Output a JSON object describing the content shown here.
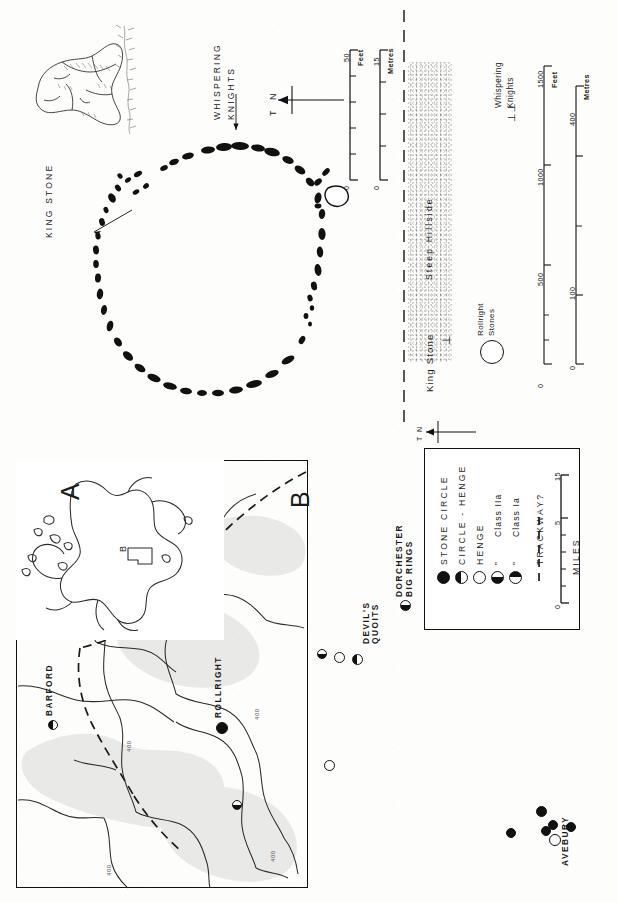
{
  "figure": {
    "orientation": "rotated-90-clockwise",
    "panels": [
      "map-A-britain-inset",
      "map-B-region",
      "legend",
      "rollright-circle-plan",
      "site-context-plan"
    ]
  },
  "map_a": {
    "panel_letter": "A",
    "inset_label": "B",
    "description": "outline of Britain with rectangle marking area B"
  },
  "map_b": {
    "panel_letter": "B",
    "sites": [
      {
        "name": "BARFORD",
        "symbol": "circle-half-left",
        "x": 52,
        "y": 724
      },
      {
        "name": "ROLLRIGHT",
        "symbol": "circle-filled",
        "x": 221,
        "y": 726
      },
      {
        "name": "DEVIL'S QUOITS",
        "symbol": "circle-half-bottom",
        "x": 343,
        "y": 652
      },
      {
        "name": "DORCHESTER BIG RINGS",
        "symbol": "circle-half-bottom",
        "x": 402,
        "y": 604
      },
      {
        "name": "AVEBURY",
        "symbol": "circle-open",
        "x": 540,
        "y": 832
      }
    ],
    "contour_labels": [
      "400",
      "400",
      "400",
      "400"
    ],
    "trackway_style": "dashed line"
  },
  "legend": {
    "entries": [
      {
        "symbol": "circle-filled",
        "label": "STONE CIRCLE"
      },
      {
        "symbol": "circle-half-left",
        "label": "CIRCLE - HENGE"
      },
      {
        "symbol": "circle-open",
        "label": "HENGE"
      },
      {
        "symbol": "circle-half-top",
        "label": "Class IIa",
        "prefix": "”"
      },
      {
        "symbol": "circle-half-bottom",
        "label": "Class Ia",
        "prefix": "”"
      },
      {
        "symbol": "dashed-line",
        "label": "TRACKWAY?"
      }
    ],
    "scale": {
      "unit": "MILES",
      "ticks": [
        "0",
        "5",
        "15"
      ],
      "min": 0,
      "max": 15
    }
  },
  "circle_plan": {
    "labels": [
      {
        "text": "KING STONE",
        "type": "annotation-with-arrow"
      },
      {
        "text": "WHISPERING KNIGHTS",
        "type": "annotation-with-arrow"
      }
    ],
    "north_arrow": {
      "label_true": "T",
      "label_north": "N"
    },
    "stone_count_visible": 60,
    "scale_feet": {
      "unit": "Feet",
      "ticks": [
        "0",
        "50"
      ],
      "min": 0,
      "max": 50
    },
    "scale_metres": {
      "unit": "Metres",
      "ticks": [
        "0",
        "15"
      ],
      "min": 0,
      "max": 15
    },
    "king_stone_drawing": "shaded pen drawing of the King Stone megalith"
  },
  "context_plan": {
    "hillside_label": "Steep Hillside",
    "markers": [
      {
        "text": "King Stone",
        "glyph": "⊥"
      },
      {
        "text": "Rollright Stones",
        "glyph": "circle"
      },
      {
        "text": "Whispering Knights",
        "glyph": "⊥⊥"
      }
    ],
    "north_arrow": {
      "label_true": "T",
      "label_north": "N"
    },
    "scale_feet": {
      "unit": "Feet",
      "ticks": [
        "0",
        "500",
        "1000",
        "1500"
      ],
      "min": 0,
      "max": 1500
    },
    "scale_metres": {
      "unit": "Metres",
      "ticks": [
        "0",
        "100",
        "400"
      ],
      "min": 0,
      "max": 400
    }
  },
  "colors": {
    "ink": "#111111",
    "paper": "#fdfdfc",
    "shade": "#e9e9e7"
  }
}
